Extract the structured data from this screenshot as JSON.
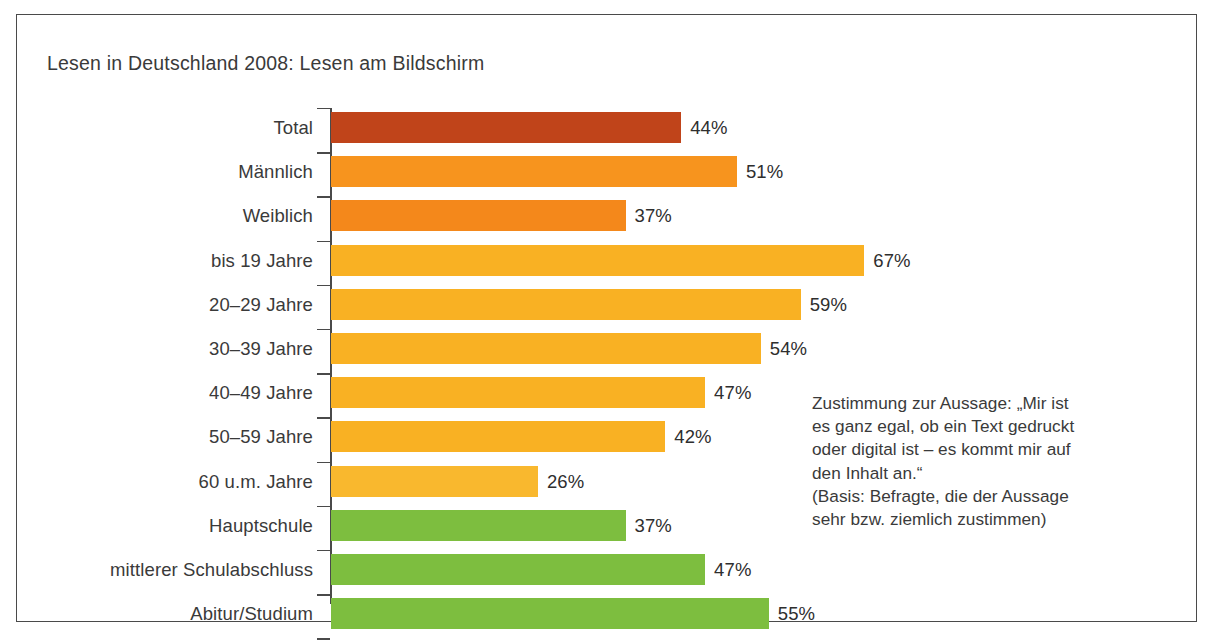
{
  "figure": {
    "title": "Lesen in Deutschland 2008: Lesen am Bildschirm",
    "border_color": "#4a4a4a",
    "background": "#ffffff"
  },
  "annotation": {
    "lines": [
      "Zustimmung zur Aussage: „Mir ist",
      "es ganz egal, ob ein Text gedruckt",
      "oder digital ist – es kommt mir auf",
      "den Inhalt an.“",
      "(Basis: Befragte, die der Aussage",
      "sehr bzw. ziemlich zustimmen)"
    ]
  },
  "chart_data": {
    "type": "bar",
    "orientation": "horizontal",
    "title": "Lesen in Deutschland 2008: Lesen am Bildschirm",
    "xlabel": "",
    "ylabel": "",
    "xlim": [
      0,
      70
    ],
    "grid": false,
    "legend": "none",
    "value_suffix": "%",
    "categories": [
      "Total",
      "Männlich",
      "Weiblich",
      "bis 19 Jahre",
      "20–29 Jahre",
      "30–39 Jahre",
      "40–49 Jahre",
      "50–59 Jahre",
      "60 u.m. Jahre",
      "Hauptschule",
      "mittlerer Schulabschluss",
      "Abitur/Studium"
    ],
    "values": [
      44,
      51,
      37,
      67,
      59,
      54,
      47,
      42,
      26,
      37,
      47,
      55
    ],
    "value_labels": [
      "44%",
      "51%",
      "37%",
      "67%",
      "59%",
      "54%",
      "47%",
      "42%",
      "26%",
      "37%",
      "47%",
      "55%"
    ],
    "colors": [
      "#c0441a",
      "#f7941e",
      "#f4881b",
      "#f9b123",
      "#f9b123",
      "#f9b123",
      "#f9b123",
      "#f9b123",
      "#f9b82e",
      "#7dbe3f",
      "#7dbe3f",
      "#7dbe3f"
    ],
    "groups": [
      {
        "name": "Gesamt",
        "color": "#c0441a",
        "categories": [
          "Total"
        ]
      },
      {
        "name": "Geschlecht",
        "color": "#f7941e",
        "categories": [
          "Männlich",
          "Weiblich"
        ]
      },
      {
        "name": "Alter",
        "color": "#f9b123",
        "categories": [
          "bis 19 Jahre",
          "20–29 Jahre",
          "30–39 Jahre",
          "40–49 Jahre",
          "50–59 Jahre",
          "60 u.m. Jahre"
        ]
      },
      {
        "name": "Bildung",
        "color": "#7dbe3f",
        "categories": [
          "Hauptschule",
          "mittlerer Schulabschluss",
          "Abitur/Studium"
        ]
      }
    ]
  }
}
